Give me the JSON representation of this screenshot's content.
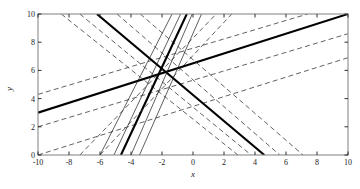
{
  "chart_data": {
    "type": "line",
    "title": "",
    "xlabel": "x",
    "ylabel": "y",
    "xlim": [
      -10,
      10
    ],
    "ylim": [
      0,
      10
    ],
    "xticks": [
      -10,
      -8,
      -6,
      -4,
      -2,
      0,
      2,
      4,
      6,
      8,
      10
    ],
    "yticks": [
      0,
      2,
      4,
      6,
      8,
      10
    ],
    "grid": false,
    "legend": null,
    "intersection_point": {
      "x": -1.75,
      "y": 5.55
    },
    "series": [
      {
        "name": "line-1-solid",
        "style": "solid",
        "width": 2.1,
        "color": "#000000",
        "slope": 0.345,
        "intercept": 6.15,
        "points": [
          {
            "x": -10,
            "y": 3.0
          },
          {
            "x": 10,
            "y": 10.0
          }
        ]
      },
      {
        "name": "line-1-dash-upper",
        "style": "dashed",
        "width": 0.8,
        "color": "#3a3a3a",
        "slope": 0.345,
        "intercept": 7.45,
        "points": [
          {
            "x": -10,
            "y": 4.3
          },
          {
            "x": 7.4,
            "y": 10.0
          }
        ]
      },
      {
        "name": "line-1-dash-lower",
        "style": "dashed",
        "width": 0.8,
        "color": "#3a3a3a",
        "slope": 0.345,
        "intercept": 5.1,
        "points": [
          {
            "x": -10,
            "y": 2.0
          },
          {
            "x": 10,
            "y": 8.6
          }
        ]
      },
      {
        "name": "line-1-dash-lower2",
        "style": "dashed",
        "width": 0.8,
        "color": "#3a3a3a",
        "slope": 0.345,
        "intercept": 3.45,
        "points": [
          {
            "x": -10,
            "y": 0.0
          },
          {
            "x": 10,
            "y": 6.9
          }
        ]
      },
      {
        "name": "line-2-solid",
        "style": "solid",
        "width": 2.1,
        "color": "#000000",
        "slope": -0.7,
        "intercept": 4.33,
        "points": [
          {
            "x": -6.2,
            "y": 10.0
          },
          {
            "x": 4.6,
            "y": 0.0
          }
        ]
      },
      {
        "name": "line-2-dash-upper",
        "style": "dashed",
        "width": 0.8,
        "color": "#3a3a3a",
        "slope": -0.7,
        "intercept": 5.95,
        "points": [
          {
            "x": -8.5,
            "y": 10.0
          },
          {
            "x": 2.9,
            "y": 0.0
          }
        ]
      },
      {
        "name": "line-2-dash-mid",
        "style": "dashed",
        "width": 0.8,
        "color": "#3a3a3a",
        "slope": -0.7,
        "intercept": 5.15,
        "points": [
          {
            "x": -7.3,
            "y": 10.0
          },
          {
            "x": 3.75,
            "y": 0.0
          }
        ]
      },
      {
        "name": "line-2-dash-lower",
        "style": "dashed",
        "width": 0.8,
        "color": "#3a3a3a",
        "slope": -0.7,
        "intercept": 3.45,
        "points": [
          {
            "x": -4.9,
            "y": 10.0
          },
          {
            "x": 5.6,
            "y": 0.0
          }
        ]
      },
      {
        "name": "line-2-dash-lower2",
        "style": "dashed",
        "width": 0.8,
        "color": "#3a3a3a",
        "slope": -0.7,
        "intercept": 2.4,
        "points": [
          {
            "x": -3.4,
            "y": 10.0
          },
          {
            "x": 7.1,
            "y": 0.0
          }
        ]
      },
      {
        "name": "line-3-solid",
        "style": "solid",
        "width": 2.1,
        "color": "#000000",
        "slope": 3.3,
        "intercept": 11.33,
        "points": [
          {
            "x": -4.65,
            "y": 0.0
          },
          {
            "x": -0.4,
            "y": 10.0
          }
        ]
      },
      {
        "name": "line-3-thin-left",
        "style": "solid",
        "width": 0.7,
        "color": "#1a1a1a",
        "slope": 3.3,
        "intercept": 14.5,
        "points": [
          {
            "x": -6.0,
            "y": 0.0
          },
          {
            "x": -1.35,
            "y": 10.0
          }
        ]
      },
      {
        "name": "line-3-thin-left2",
        "style": "solid",
        "width": 0.7,
        "color": "#1a1a1a",
        "slope": 3.3,
        "intercept": 12.6,
        "points": [
          {
            "x": -5.1,
            "y": 0.0
          },
          {
            "x": -0.8,
            "y": 10.0
          }
        ]
      },
      {
        "name": "line-3-thin-right",
        "style": "solid",
        "width": 0.7,
        "color": "#1a1a1a",
        "slope": 3.3,
        "intercept": 10.2,
        "points": [
          {
            "x": -4.0,
            "y": 0.0
          },
          {
            "x": -0.05,
            "y": 10.0
          }
        ]
      },
      {
        "name": "line-3-thin-right2",
        "style": "solid",
        "width": 0.7,
        "color": "#1a1a1a",
        "slope": 3.3,
        "intercept": 8.6,
        "points": [
          {
            "x": -3.45,
            "y": 0.0
          },
          {
            "x": 0.55,
            "y": 10.0
          }
        ]
      },
      {
        "name": "line-4-dash-steep-a",
        "style": "dashed",
        "width": 0.8,
        "color": "#3a3a3a",
        "slope": 1.45,
        "intercept": 7.75,
        "points": [
          {
            "x": -7.3,
            "y": 0.0
          },
          {
            "x": 1.5,
            "y": 10.0
          }
        ]
      },
      {
        "name": "line-4-dash-steep-b",
        "style": "dashed",
        "width": 0.8,
        "color": "#3a3a3a",
        "slope": 1.45,
        "intercept": 6.4,
        "points": [
          {
            "x": -6.0,
            "y": 0.0
          },
          {
            "x": 2.5,
            "y": 10.0
          }
        ]
      }
    ]
  },
  "axes": {
    "xlabel": "x",
    "ylabel": "y",
    "xticks": [
      "-10",
      "-8",
      "-6",
      "-4",
      "-2",
      "0",
      "2",
      "4",
      "6",
      "8",
      "10"
    ],
    "yticks": [
      "0",
      "2",
      "4",
      "6",
      "8",
      "10"
    ],
    "frame_color": "#808080",
    "tick_color": "#1a1a1a"
  }
}
